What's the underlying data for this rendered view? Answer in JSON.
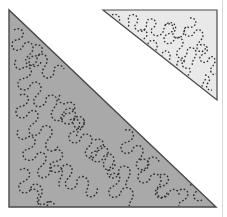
{
  "illustration": {
    "subject": "Two right-triangle quilt patches with meandering dashed stipple stitching",
    "colors": {
      "background": "#ffffff",
      "large_fill": "#a9a9a9",
      "small_fill": "#e9e9e9",
      "outline": "#4a4a4a",
      "stitch": "#2e2e2e",
      "edge_line": "#d6d6d6"
    },
    "large_triangle": {
      "points": "9,10 9,207 216,207"
    },
    "small_triangle": {
      "points": "103,10 217,10 217,100"
    }
  }
}
